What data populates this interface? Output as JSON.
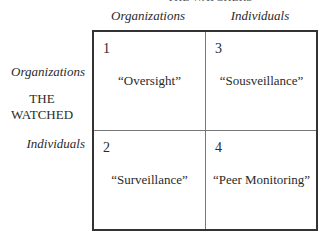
{
  "title_top": "THE WATCHERS",
  "columns": [
    "Organizations",
    "Individuals"
  ],
  "rows": [
    "Organizations",
    "Individuals"
  ],
  "side_title": [
    "THE",
    "WATCHED"
  ],
  "cells": [
    {
      "number": "1",
      "label": "“Oversight”"
    },
    {
      "number": "2",
      "label": "“Surveillance”"
    },
    {
      "number": "3",
      "label": "“Sousveillance”"
    },
    {
      "number": "4",
      "label": "“Peer Monitoring”"
    }
  ]
}
